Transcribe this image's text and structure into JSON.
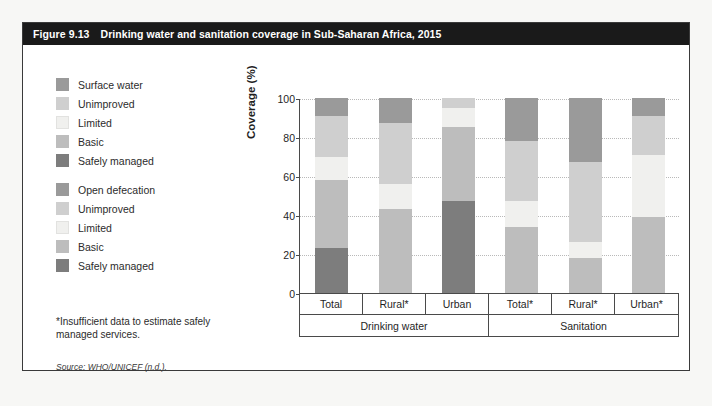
{
  "figure": {
    "number": "Figure 9.13",
    "title": "Drinking water and sanitation coverage in Sub-Saharan Africa, 2015",
    "footnote": "*Insufficient data to estimate safely managed services.",
    "source": "Source: WHO/UNICEF (n.d.)."
  },
  "colors": {
    "surface_water": "#9a9a9a",
    "open_defecation": "#9a9a9a",
    "unimproved": "#cfcfcf",
    "limited": "#f0f0ee",
    "basic": "#bdbdbd",
    "safely_managed": "#7d7d7d",
    "title_bar": "#1a1a1a",
    "page_bg": "#f7f7f5"
  },
  "legends": [
    {
      "id": "legend-water",
      "items": [
        {
          "label": "Surface water",
          "color": "#9a9a9a",
          "key": "surface_water"
        },
        {
          "label": "Unimproved",
          "color": "#cfcfcf",
          "key": "unimproved"
        },
        {
          "label": "Limited",
          "color": "#f0f0ee",
          "key": "limited"
        },
        {
          "label": "Basic",
          "color": "#bdbdbd",
          "key": "basic"
        },
        {
          "label": "Safely managed",
          "color": "#7d7d7d",
          "key": "safely_managed"
        }
      ]
    },
    {
      "id": "legend-sanitation",
      "items": [
        {
          "label": "Open defecation",
          "color": "#9a9a9a",
          "key": "open_defecation"
        },
        {
          "label": "Unimproved",
          "color": "#cfcfcf",
          "key": "unimproved"
        },
        {
          "label": "Limited",
          "color": "#f0f0ee",
          "key": "limited"
        },
        {
          "label": "Basic",
          "color": "#bdbdbd",
          "key": "basic"
        },
        {
          "label": "Safely managed",
          "color": "#7d7d7d",
          "key": "safely_managed"
        }
      ]
    }
  ],
  "chart_data": {
    "type": "bar",
    "stacked": true,
    "title": "Drinking water and sanitation coverage in Sub-Saharan Africa, 2015",
    "xlabel": "",
    "ylabel": "Coverage (%)",
    "ylim": [
      0,
      100
    ],
    "yticks": [
      0,
      20,
      40,
      60,
      80,
      100
    ],
    "ytick_labels": [
      "0",
      "20",
      "40",
      "60",
      "80",
      "100"
    ],
    "grid": true,
    "legend_position": "left",
    "groups": [
      {
        "label": "Drinking water",
        "categories": [
          "Total",
          "Rural*",
          "Urban"
        ]
      },
      {
        "label": "Sanitation",
        "categories": [
          "Total*",
          "Rural*",
          "Urban*"
        ]
      }
    ],
    "categories": [
      "Total",
      "Rural*",
      "Urban",
      "Total*",
      "Rural*",
      "Urban*"
    ],
    "series": [
      {
        "name": "Safely managed",
        "color": "#7d7d7d",
        "values": [
          23,
          0,
          47,
          0,
          0,
          0
        ]
      },
      {
        "name": "Basic",
        "color": "#bdbdbd",
        "values": [
          35,
          43,
          11,
          34,
          18,
          39
        ]
      },
      {
        "name": "Limited",
        "color": "#f0f0ee",
        "values": [
          12,
          13,
          10,
          13,
          8,
          32
        ]
      },
      {
        "name": "Unimproved",
        "color": "#cfcfcf",
        "values": [
          21,
          31,
          27,
          31,
          41,
          20
        ]
      },
      {
        "name": "Surface water / Open defecation",
        "color": "#9a9a9a",
        "values": [
          9,
          13,
          5,
          22,
          33,
          9
        ]
      }
    ],
    "bars": [
      {
        "category": "Total",
        "group": "Drinking water",
        "segments": [
          {
            "name": "Safely managed",
            "value": 23,
            "color": "#7d7d7d"
          },
          {
            "name": "Basic",
            "value": 35,
            "color": "#bdbdbd"
          },
          {
            "name": "Limited",
            "value": 12,
            "color": "#f0f0ee"
          },
          {
            "name": "Unimproved",
            "value": 21,
            "color": "#cfcfcf"
          },
          {
            "name": "Surface water",
            "value": 9,
            "color": "#9a9a9a"
          }
        ]
      },
      {
        "category": "Rural*",
        "group": "Drinking water",
        "segments": [
          {
            "name": "Basic",
            "value": 43,
            "color": "#bdbdbd"
          },
          {
            "name": "Limited",
            "value": 13,
            "color": "#f0f0ee"
          },
          {
            "name": "Unimproved",
            "value": 31,
            "color": "#cfcfcf"
          },
          {
            "name": "Surface water",
            "value": 13,
            "color": "#9a9a9a"
          }
        ]
      },
      {
        "category": "Urban",
        "group": "Drinking water",
        "segments": [
          {
            "name": "Safely managed",
            "value": 47,
            "color": "#7d7d7d"
          },
          {
            "name": "Basic",
            "value": 38,
            "color": "#bdbdbd"
          },
          {
            "name": "Limited",
            "value": 10,
            "color": "#f0f0ee"
          },
          {
            "name": "Unimproved",
            "value": 5,
            "color": "#cfcfcf"
          }
        ]
      },
      {
        "category": "Total*",
        "group": "Sanitation",
        "segments": [
          {
            "name": "Basic",
            "value": 34,
            "color": "#bdbdbd"
          },
          {
            "name": "Limited",
            "value": 13,
            "color": "#f0f0ee"
          },
          {
            "name": "Unimproved",
            "value": 31,
            "color": "#cfcfcf"
          },
          {
            "name": "Open defecation",
            "value": 22,
            "color": "#9a9a9a"
          }
        ]
      },
      {
        "category": "Rural*",
        "group": "Sanitation",
        "segments": [
          {
            "name": "Basic",
            "value": 18,
            "color": "#bdbdbd"
          },
          {
            "name": "Limited",
            "value": 8,
            "color": "#f0f0ee"
          },
          {
            "name": "Unimproved",
            "value": 41,
            "color": "#cfcfcf"
          },
          {
            "name": "Open defecation",
            "value": 33,
            "color": "#9a9a9a"
          }
        ]
      },
      {
        "category": "Urban*",
        "group": "Sanitation",
        "segments": [
          {
            "name": "Basic",
            "value": 39,
            "color": "#bdbdbd"
          },
          {
            "name": "Limited",
            "value": 32,
            "color": "#f0f0ee"
          },
          {
            "name": "Unimproved",
            "value": 20,
            "color": "#cfcfcf"
          },
          {
            "name": "Open defecation",
            "value": 9,
            "color": "#9a9a9a"
          }
        ]
      }
    ]
  }
}
